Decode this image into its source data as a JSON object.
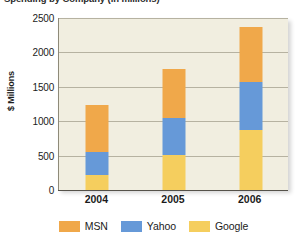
{
  "title_clipped": "Spending by Company (in millions)",
  "chart_data": {
    "type": "bar",
    "subtype": "stacked-bar",
    "title": "",
    "xlabel": "",
    "ylabel": "$ Millions",
    "categories": [
      "2004",
      "2005",
      "2006"
    ],
    "ylim": [
      0,
      2500
    ],
    "yticks": [
      0,
      500,
      1000,
      1500,
      2000,
      2500
    ],
    "ytick_labels": [
      "0",
      "500",
      "1000",
      "1500",
      "2000",
      "2500"
    ],
    "grid": true,
    "legend_position": "bottom",
    "stack_order_bottom_to_top": [
      "Google",
      "Yahoo",
      "MSN"
    ],
    "series": [
      {
        "name": "MSN",
        "color": "#f0a84a",
        "values": [
          680,
          710,
          795
        ]
      },
      {
        "name": "Yahoo",
        "color": "#6699d8",
        "values": [
          330,
          540,
          700
        ]
      },
      {
        "name": "Google",
        "color": "#f5ce5e",
        "values": [
          220,
          510,
          875
        ]
      }
    ],
    "totals": [
      1230,
      1760,
      2370
    ],
    "plot_background": "#f1eee0",
    "gridline_color": "#b6b2a1"
  },
  "legend": {
    "items": [
      {
        "label": "MSN",
        "color": "#f0a84a"
      },
      {
        "label": "Yahoo",
        "color": "#6699d8"
      },
      {
        "label": "Google",
        "color": "#f5ce5e"
      }
    ]
  }
}
